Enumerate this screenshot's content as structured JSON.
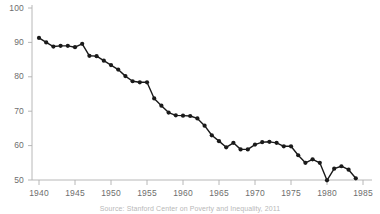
{
  "chart_data": {
    "type": "line",
    "title": "",
    "subtitle": "",
    "xlabel": "",
    "ylabel": "",
    "xlim": [
      1939,
      1986
    ],
    "ylim": [
      45,
      102
    ],
    "grid": false,
    "legend": "none",
    "marker": "filled-circle",
    "line_color": "#1a1a1a",
    "marker_color": "#1a1a1a",
    "axis_color": "#b0b0b0",
    "background_color": "#ffffff",
    "xticks": [
      1940,
      1945,
      1950,
      1955,
      1960,
      1965,
      1970,
      1975,
      1980,
      1985
    ],
    "xtick_labels": [
      "1940",
      "1945",
      "1950",
      "1955",
      "1960",
      "1965",
      "1970",
      "1975",
      "1980",
      "1985"
    ],
    "yticks": [
      50,
      60,
      70,
      80,
      90,
      100
    ],
    "ytick_labels": [
      "50",
      "60",
      "70",
      "80",
      "90",
      "100"
    ],
    "x": [
      1940,
      1941,
      1942,
      1943,
      1944,
      1945,
      1946,
      1947,
      1948,
      1949,
      1950,
      1951,
      1952,
      1953,
      1954,
      1955,
      1956,
      1957,
      1958,
      1959,
      1960,
      1961,
      1962,
      1963,
      1964,
      1965,
      1966,
      1967,
      1968,
      1969,
      1970,
      1971,
      1972,
      1973,
      1974,
      1975,
      1976,
      1977,
      1978,
      1979,
      1980,
      1981,
      1982,
      1983,
      1984
    ],
    "values": [
      91.3,
      90.0,
      88.8,
      89.0,
      89.0,
      88.6,
      89.6,
      86.1,
      86.0,
      84.7,
      83.4,
      82.1,
      80.2,
      78.7,
      78.4,
      78.4,
      73.7,
      71.6,
      69.6,
      68.8,
      68.7,
      68.6,
      67.9,
      65.8,
      63.0,
      61.3,
      59.5,
      60.8,
      58.9,
      58.9,
      60.3,
      61.0,
      61.1,
      60.8,
      59.8,
      59.8,
      57.2,
      55.0,
      56.0,
      55.0,
      49.9,
      53.3,
      54.0,
      53.0,
      50.5
    ],
    "annotations": []
  },
  "caption": {
    "text": "Source: Stanford Center on Poverty and Inequality, 2011"
  },
  "axes": {
    "y_axis_name": "y-axis",
    "x_axis_name": "x-axis"
  }
}
